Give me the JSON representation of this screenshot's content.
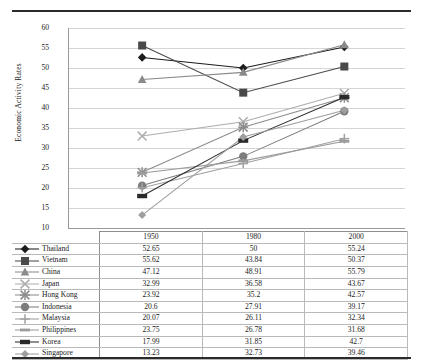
{
  "chart_data": {
    "type": "line",
    "title": "",
    "xlabel": "",
    "ylabel": "Economic Activity Rates",
    "categories": [
      "1950",
      "1980",
      "2000"
    ],
    "ylim": [
      10,
      60
    ],
    "ytick_step": 5,
    "yticks": [
      "60",
      "55",
      "50",
      "45",
      "40",
      "35",
      "30",
      "25",
      "20",
      "15",
      "10"
    ],
    "grid": true,
    "legend_position": "table-row-headers",
    "series": [
      {
        "name": "Thailand",
        "marker": "diamond",
        "color": "#1c1c1c",
        "values": [
          52.65,
          50,
          55.24
        ]
      },
      {
        "name": "Vietnam",
        "marker": "square",
        "color": "#4a4a4a",
        "values": [
          55.62,
          43.84,
          50.37
        ]
      },
      {
        "name": "China",
        "marker": "triangle",
        "color": "#8a8a8a",
        "values": [
          47.12,
          48.91,
          55.79
        ]
      },
      {
        "name": "Japan",
        "marker": "cross-x",
        "color": "#adadad",
        "values": [
          32.99,
          36.58,
          43.67
        ]
      },
      {
        "name": "Hong Kong",
        "marker": "asterisk",
        "color": "#8c8c8c",
        "values": [
          23.92,
          35.2,
          42.57
        ]
      },
      {
        "name": "Indonesia",
        "marker": "circle",
        "color": "#7d7d7d",
        "values": [
          20.6,
          27.91,
          39.17
        ]
      },
      {
        "name": "Malaysia",
        "marker": "plus",
        "color": "#a0a0a0",
        "values": [
          20.07,
          26.11,
          32.34
        ]
      },
      {
        "name": "Philippines",
        "marker": "dash",
        "color": "#9b9b9b",
        "values": [
          23.75,
          26.78,
          31.68
        ]
      },
      {
        "name": "Korea",
        "marker": "dash-bold",
        "color": "#2a2a2a",
        "values": [
          17.99,
          31.85,
          42.7
        ]
      },
      {
        "name": "Singapore",
        "marker": "diamond-light",
        "color": "#9e9e9e",
        "values": [
          13.23,
          32.73,
          39.46
        ]
      }
    ]
  },
  "table": {
    "corner_label": "",
    "headers": [
      "1950",
      "1980",
      "2000"
    ],
    "rows": [
      {
        "name": "Thailand",
        "values": [
          "52.65",
          "50",
          "55.24"
        ]
      },
      {
        "name": "Vietnam",
        "values": [
          "55.62",
          "43.84",
          "50.37"
        ]
      },
      {
        "name": "China",
        "values": [
          "47.12",
          "48.91",
          "55.79"
        ]
      },
      {
        "name": "Japan",
        "values": [
          "32.99",
          "36.58",
          "43.67"
        ]
      },
      {
        "name": "Hong Kong",
        "values": [
          "23.92",
          "35.2",
          "42.57"
        ]
      },
      {
        "name": "Indonesia",
        "values": [
          "20.6",
          "27.91",
          "39.17"
        ]
      },
      {
        "name": "Malaysia",
        "values": [
          "20.07",
          "26.11",
          "32.34"
        ]
      },
      {
        "name": "Philippines",
        "values": [
          "23.75",
          "26.78",
          "31.68"
        ]
      },
      {
        "name": "Korea",
        "values": [
          "17.99",
          "31.85",
          "42.7"
        ]
      },
      {
        "name": "Singapore",
        "values": [
          "13.23",
          "32.73",
          "39.46"
        ]
      }
    ]
  }
}
